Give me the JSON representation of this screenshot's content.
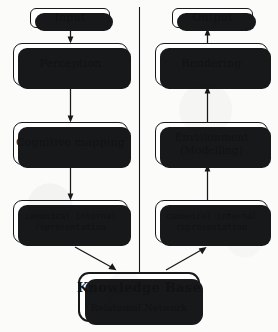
{
  "figure": {
    "ink_color": "#17181a",
    "paper_color": "#fbfbf9",
    "box_fill": "#ffffff"
  },
  "columns": {
    "left": {
      "name": "perception-pipeline",
      "flow_direction": "downward",
      "nodes": [
        {
          "id": "input",
          "label": "Input",
          "shape": "rounded-pill"
        },
        {
          "id": "perception",
          "label": "Perception",
          "shape": "rounded-box"
        },
        {
          "id": "cognitive-mapping",
          "label": "Cognitive mapping",
          "shape": "rounded-box"
        },
        {
          "id": "canonical-left",
          "line1": "canonical internal",
          "line2": "representation",
          "shape": "rounded-box"
        }
      ]
    },
    "right": {
      "name": "generation-pipeline",
      "flow_direction": "upward",
      "nodes": [
        {
          "id": "output",
          "label": "Output",
          "shape": "rounded-pill"
        },
        {
          "id": "rendering",
          "label": "Rendering",
          "shape": "rounded-box"
        },
        {
          "id": "envisionment",
          "line1": "Envisionment",
          "line2": "(Modelling)",
          "shape": "rounded-box"
        },
        {
          "id": "canonical-right",
          "line1": "canonical internal",
          "line2": "representation",
          "shape": "rounded-box"
        }
      ]
    }
  },
  "knowledge_base": {
    "id": "knowledge-base",
    "title": "Knowledge Base",
    "subtitle": "Relational Network"
  },
  "connections": [
    {
      "from": "input",
      "to": "perception",
      "arrow": "down"
    },
    {
      "from": "perception",
      "to": "cognitive-mapping",
      "arrow": "down"
    },
    {
      "from": "cognitive-mapping",
      "to": "canonical-left",
      "arrow": "down"
    },
    {
      "from": "canonical-left",
      "to": "knowledge-base",
      "arrow": "diagonal-down-right"
    },
    {
      "from": "knowledge-base",
      "to": "canonical-right",
      "arrow": "diagonal-up-right"
    },
    {
      "from": "canonical-right",
      "to": "envisionment",
      "arrow": "up"
    },
    {
      "from": "envisionment",
      "to": "rendering",
      "arrow": "up"
    },
    {
      "from": "rendering",
      "to": "output",
      "arrow": "up"
    }
  ],
  "divider": {
    "name": "column-divider",
    "orientation": "vertical"
  }
}
